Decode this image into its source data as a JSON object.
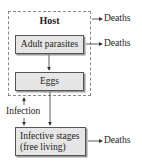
{
  "diagram": {
    "host_label": "Host",
    "nodes": {
      "adult": "Adult parasites",
      "eggs": "Eggs",
      "infective_line1": "Infective stages",
      "infective_line2": "(free living)"
    },
    "deaths_label": "Deaths",
    "infection_label": "Infection",
    "edges": [
      {
        "from": "host",
        "to": "deaths"
      },
      {
        "from": "adult",
        "to": "deaths"
      },
      {
        "from": "adult",
        "to": "eggs"
      },
      {
        "from": "eggs",
        "to": "infective"
      },
      {
        "from": "infective",
        "to": "host",
        "label": "Infection"
      },
      {
        "from": "infective",
        "to": "deaths"
      }
    ]
  }
}
